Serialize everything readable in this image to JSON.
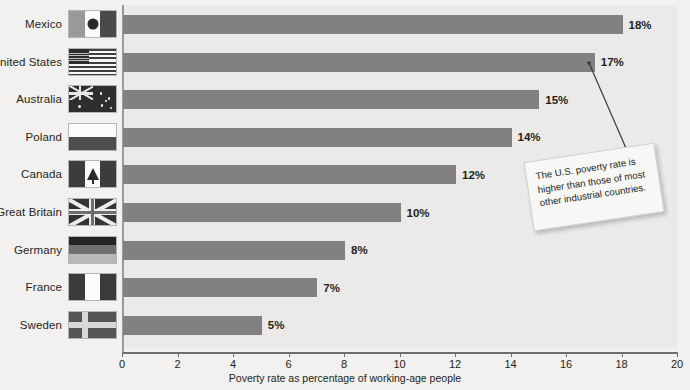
{
  "chart_data": {
    "type": "bar",
    "orientation": "horizontal",
    "title": "",
    "xlabel": "Poverty rate as percentage of working-age people",
    "ylabel": "",
    "xlim": [
      0,
      20
    ],
    "xticks": [
      0,
      2,
      4,
      6,
      8,
      10,
      12,
      14,
      16,
      18,
      20
    ],
    "grid": false,
    "legend": "none",
    "categories": [
      "Mexico",
      "United States",
      "Australia",
      "Poland",
      "Canada",
      "Great Britain",
      "Germany",
      "France",
      "Sweden"
    ],
    "values": [
      18,
      17,
      15,
      14,
      12,
      10,
      8,
      7,
      5
    ],
    "value_labels": [
      "18%",
      "17%",
      "15%",
      "14%",
      "12%",
      "10%",
      "8%",
      "7%",
      "5%"
    ],
    "annotations": [
      {
        "text": "The U.S. poverty rate is higher than those of most other industrial countries.",
        "points_at": "United States"
      }
    ],
    "bar_color": "#818181",
    "plot_background": "#eceae8",
    "page_background": "#f2f1ef"
  },
  "rows": [
    {
      "country": "Mexico",
      "value": 18,
      "label": "18%",
      "flag": "flag-mexico"
    },
    {
      "country": "United States",
      "value": 17,
      "label": "17%",
      "flag": "flag-united-states"
    },
    {
      "country": "Australia",
      "value": 15,
      "label": "15%",
      "flag": "flag-australia"
    },
    {
      "country": "Poland",
      "value": 14,
      "label": "14%",
      "flag": "flag-poland"
    },
    {
      "country": "Canada",
      "value": 12,
      "label": "12%",
      "flag": "flag-canada"
    },
    {
      "country": "Great Britain",
      "value": 10,
      "label": "10%",
      "flag": "flag-great-britain"
    },
    {
      "country": "Germany",
      "value": 8,
      "label": "8%",
      "flag": "flag-germany"
    },
    {
      "country": "France",
      "value": 7,
      "label": "7%",
      "flag": "flag-france"
    },
    {
      "country": "Sweden",
      "value": 5,
      "label": "5%",
      "flag": "flag-sweden"
    }
  ],
  "axis": {
    "ticks": [
      "0",
      "2",
      "4",
      "6",
      "8",
      "10",
      "12",
      "14",
      "16",
      "18",
      "20"
    ],
    "title": "Poverty rate as percentage of working-age people"
  },
  "callout": {
    "text": "The U.S. poverty rate is higher than those of most other industrial countries."
  }
}
